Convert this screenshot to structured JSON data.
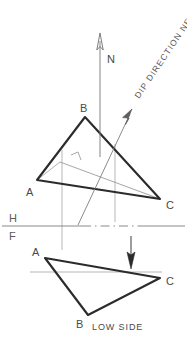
{
  "figure": {
    "background_color": "#ffffff",
    "ink_color": "#2b2b2b",
    "thin_ink_color": "#8a8a8a",
    "label_color": "#4a4a4a",
    "width": 187,
    "height": 351
  },
  "annotations": {
    "north_label": "N",
    "dip_direction_label": "DIP DIRECTION NE",
    "low_side_label": "LOW SIDE",
    "horizontal_plane_label": "H",
    "frontal_plane_label": "F"
  },
  "top_view": {
    "name": "horizontal projection",
    "vertex_labels": {
      "a": "A",
      "b": "B",
      "c": "C"
    },
    "vertices": {
      "a": {
        "x": 37,
        "y": 180
      },
      "b": {
        "x": 85,
        "y": 117
      },
      "c": {
        "x": 160,
        "y": 199
      }
    },
    "label_positions": {
      "a": {
        "x": 26,
        "y": 196
      },
      "b": {
        "x": 80,
        "y": 112
      },
      "c": {
        "x": 166,
        "y": 209
      }
    },
    "strike_line": {
      "from": {
        "x": 60,
        "y": 162
      },
      "to": {
        "x": 160,
        "y": 199
      }
    },
    "right_angle_mark": true
  },
  "front_view": {
    "name": "frontal projection",
    "vertex_labels": {
      "a": "A",
      "b": "B",
      "c": "C"
    },
    "vertices": {
      "a": {
        "x": 45,
        "y": 258
      },
      "b": {
        "x": 88,
        "y": 315
      },
      "c": {
        "x": 160,
        "y": 278
      }
    },
    "label_positions": {
      "a": {
        "x": 33,
        "y": 255
      },
      "b": {
        "x": 78,
        "y": 327
      },
      "c": {
        "x": 166,
        "y": 284
      }
    }
  },
  "reference_line": {
    "y": 226,
    "from_x": 2,
    "to_x": 185,
    "h_label_pos": {
      "x": 10,
      "y": 222
    },
    "f_label_pos": {
      "x": 10,
      "y": 240
    }
  },
  "north_arrow": {
    "x": 100,
    "from_y": 155,
    "to_y": 38,
    "label_pos": {
      "x": 107,
      "y": 62
    }
  },
  "dip_arrow": {
    "from": {
      "x": 78,
      "y": 225
    },
    "to": {
      "x": 131,
      "y": 113
    },
    "label_pos": {
      "x": 140,
      "y": 98
    },
    "label_rotation": -56
  },
  "down_arrow": {
    "x": 131,
    "from_y": 238,
    "to_y": 268
  }
}
